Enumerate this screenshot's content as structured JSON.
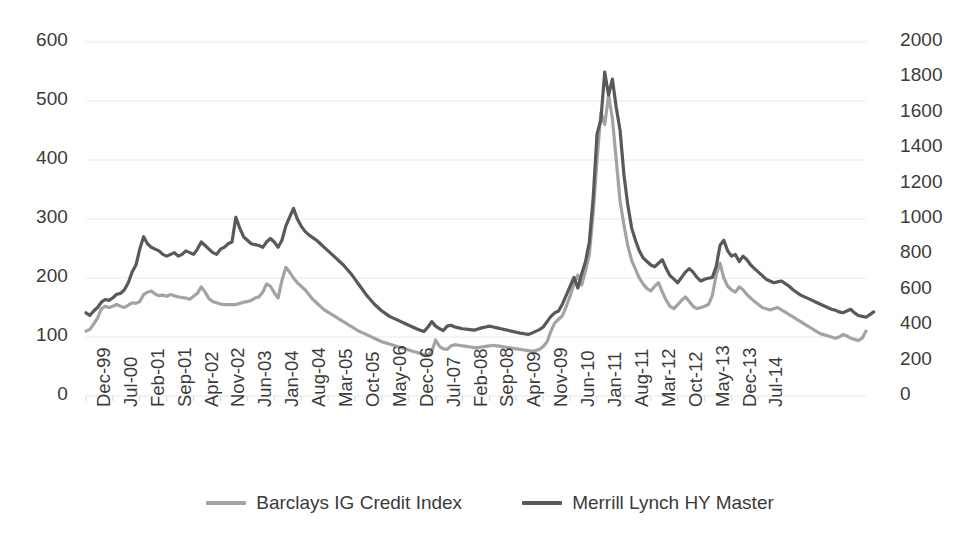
{
  "chart_data": {
    "type": "line",
    "title": "",
    "subtitle": "",
    "xlabel": "",
    "ylabel": "",
    "y2label": "",
    "grid": true,
    "legend_position": "bottom",
    "ylim": [
      0,
      600
    ],
    "y2lim": [
      0,
      2000
    ],
    "yticks": [
      "600",
      "500",
      "400",
      "300",
      "200",
      "100",
      "0"
    ],
    "ytick_values": [
      600,
      500,
      400,
      300,
      200,
      100,
      0
    ],
    "y2ticks": [
      "2000",
      "1800",
      "1600",
      "1400",
      "1200",
      "1000",
      "800",
      "600",
      "400",
      "200",
      "0"
    ],
    "y2tick_values": [
      2000,
      1800,
      1600,
      1400,
      1200,
      1000,
      800,
      600,
      400,
      200,
      0
    ],
    "xticks": [
      "Dec-99",
      "Jul-00",
      "Feb-01",
      "Sep-01",
      "Apr-02",
      "Nov-02",
      "Jun-03",
      "Jan-04",
      "Aug-04",
      "Mar-05",
      "Oct-05",
      "May-06",
      "Dec-06",
      "Jul-07",
      "Feb-08",
      "Sep-08",
      "Apr-09",
      "Nov-09",
      "Jun-10",
      "Jan-11",
      "Aug-11",
      "Mar-12",
      "Oct-12",
      "May-13",
      "Dec-13",
      "Jul-14"
    ],
    "xtick_interval_months": 7,
    "x_start": "Dec-99",
    "x_end": "Jul-14",
    "series": [
      {
        "name": "Barclays IG Credit Index",
        "color": "#a3a3a3",
        "axis": "left",
        "values": [
          110,
          113,
          122,
          132,
          148,
          152,
          150,
          152,
          155,
          152,
          150,
          154,
          158,
          157,
          160,
          172,
          176,
          178,
          173,
          170,
          171,
          169,
          172,
          170,
          168,
          167,
          166,
          164,
          169,
          174,
          185,
          176,
          165,
          160,
          158,
          156,
          155,
          155,
          155,
          155,
          157,
          159,
          160,
          162,
          166,
          168,
          176,
          190,
          186,
          175,
          166,
          196,
          218,
          210,
          200,
          192,
          186,
          180,
          172,
          164,
          158,
          152,
          146,
          142,
          138,
          134,
          130,
          126,
          122,
          118,
          114,
          110,
          107,
          104,
          101,
          98,
          95,
          92,
          90,
          88,
          86,
          84,
          82,
          80,
          78,
          76,
          74,
          72,
          70,
          69,
          76,
          95,
          84,
          80,
          79,
          85,
          87,
          86,
          85,
          84,
          83,
          82,
          82,
          83,
          84,
          85,
          86,
          85,
          84,
          83,
          82,
          81,
          80,
          79,
          78,
          77,
          76,
          77,
          79,
          84,
          92,
          110,
          124,
          130,
          136,
          152,
          170,
          190,
          205,
          188,
          212,
          240,
          310,
          400,
          480,
          460,
          510,
          470,
          400,
          330,
          290,
          255,
          230,
          215,
          200,
          190,
          182,
          178,
          186,
          192,
          176,
          162,
          152,
          148,
          155,
          162,
          168,
          160,
          152,
          148,
          150,
          152,
          155,
          170,
          205,
          225,
          200,
          186,
          180,
          176,
          185,
          180,
          172,
          166,
          160,
          155,
          150,
          148,
          146,
          148,
          150,
          146,
          142,
          138,
          134,
          130,
          126,
          122,
          118,
          114,
          110,
          106,
          104,
          102,
          100,
          98,
          100,
          104,
          102,
          98,
          96,
          94,
          98,
          110
        ]
      },
      {
        "name": "Merrill Lynch HY Master",
        "color": "#595959",
        "axis": "right",
        "values": [
          470,
          455,
          480,
          500,
          530,
          545,
          540,
          555,
          575,
          580,
          600,
          640,
          700,
          740,
          830,
          900,
          860,
          840,
          830,
          820,
          800,
          790,
          800,
          810,
          790,
          800,
          820,
          810,
          800,
          830,
          870,
          850,
          830,
          810,
          800,
          830,
          840,
          860,
          870,
          1010,
          950,
          900,
          880,
          860,
          855,
          850,
          840,
          870,
          890,
          870,
          840,
          880,
          960,
          1010,
          1060,
          1000,
          960,
          930,
          910,
          895,
          880,
          860,
          840,
          820,
          800,
          780,
          760,
          740,
          715,
          690,
          660,
          630,
          600,
          570,
          545,
          520,
          500,
          480,
          465,
          450,
          440,
          430,
          420,
          410,
          400,
          390,
          380,
          372,
          365,
          390,
          420,
          395,
          380,
          370,
          395,
          400,
          390,
          385,
          380,
          378,
          375,
          372,
          378,
          385,
          390,
          395,
          390,
          385,
          380,
          375,
          370,
          365,
          360,
          355,
          352,
          348,
          355,
          365,
          375,
          390,
          420,
          450,
          470,
          480,
          520,
          570,
          620,
          670,
          610,
          690,
          760,
          870,
          1120,
          1480,
          1560,
          1830,
          1700,
          1790,
          1630,
          1500,
          1250,
          1080,
          950,
          880,
          820,
          780,
          760,
          740,
          730,
          750,
          770,
          720,
          680,
          660,
          640,
          670,
          700,
          720,
          700,
          670,
          650,
          660,
          665,
          670,
          730,
          850,
          880,
          820,
          790,
          800,
          760,
          790,
          770,
          740,
          720,
          700,
          680,
          660,
          650,
          640,
          645,
          650,
          635,
          620,
          600,
          585,
          570,
          560,
          550,
          540,
          530,
          520,
          510,
          500,
          490,
          485,
          475,
          470,
          480,
          490,
          470,
          455,
          450,
          445,
          460,
          475
        ]
      }
    ]
  },
  "legend": {
    "items": [
      {
        "label": "Barclays IG Credit Index",
        "color": "#a3a3a3"
      },
      {
        "label": "Merrill Lynch HY Master",
        "color": "#595959"
      }
    ]
  },
  "colors": {
    "ig_line": "#a3a3a3",
    "hy_line": "#595959",
    "gridline": "#e8e8e8",
    "text": "#3b3b3b",
    "background": "#ffffff"
  }
}
